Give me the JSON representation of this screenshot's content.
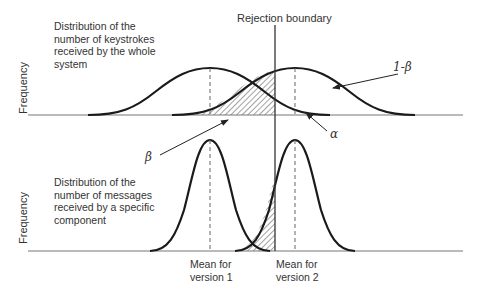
{
  "title": "Rejection boundary",
  "top_panel": {
    "description": "Distribution of the number of keystrokes received by the whole system",
    "lines": [
      "Distribution of the",
      "number of keystrokes",
      "received by the whole",
      "system"
    ],
    "y_label": "Frequency"
  },
  "bottom_panel": {
    "description": "Distribution of the number of messages received by a specific component",
    "lines": [
      "Distribution of the",
      "number of messages",
      "received by a specific",
      "component"
    ],
    "y_label": "Frequency"
  },
  "annotations": {
    "one_minus_beta": "1-β",
    "alpha": "α",
    "beta": "β"
  },
  "x_labels": {
    "mean_v1": [
      "Mean for",
      "version 1"
    ],
    "mean_v2": [
      "Mean for",
      "version 2"
    ]
  }
}
